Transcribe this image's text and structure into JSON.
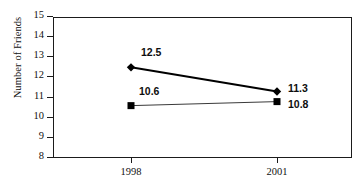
{
  "chart_data": {
    "type": "line",
    "title": "",
    "subtitle": "",
    "xlabel": "",
    "ylabel": "Number of Friends",
    "categories": [
      "1998",
      "2001"
    ],
    "x": [
      1998,
      2001
    ],
    "ylim": [
      8,
      15
    ],
    "yticks": [
      8,
      9,
      10,
      11,
      12,
      13,
      14,
      15
    ],
    "ytick_labels": [
      "8",
      "9",
      "10",
      "11",
      "12",
      "13",
      "14",
      "15"
    ],
    "grid": false,
    "legend": "none",
    "frame": "box",
    "series": [
      {
        "name": "series-diamond",
        "marker": "diamond",
        "color": "#000000",
        "line_width": 2,
        "values": [
          12.5,
          11.3
        ],
        "point_labels": [
          "12.5",
          "11.3"
        ]
      },
      {
        "name": "series-square",
        "marker": "square",
        "color": "#3a3a3a",
        "line_width": 1,
        "values": [
          10.6,
          10.8
        ],
        "point_labels": [
          "10.6",
          "10.8"
        ]
      }
    ],
    "annotations": [
      {
        "text": "12.5",
        "series": "series-diamond",
        "category": "1998",
        "position": "above-right"
      },
      {
        "text": "11.3",
        "series": "series-diamond",
        "category": "2001",
        "position": "right"
      },
      {
        "text": "10.6",
        "series": "series-square",
        "category": "1998",
        "position": "above-right"
      },
      {
        "text": "10.8",
        "series": "series-square",
        "category": "2001",
        "position": "right"
      }
    ]
  }
}
